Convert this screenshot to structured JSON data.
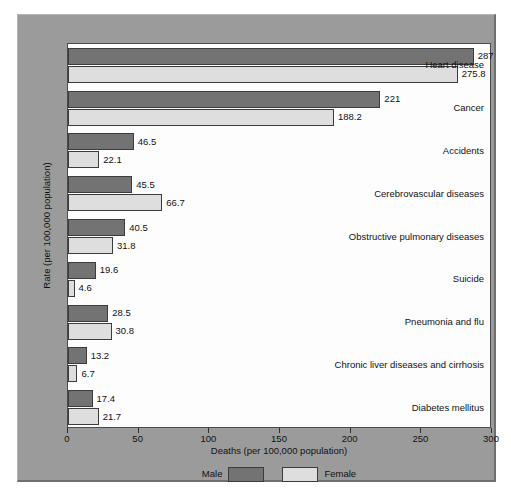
{
  "chart_data": {
    "type": "bar",
    "orientation": "horizontal",
    "title": "",
    "xlabel": "Deaths (per 100,000 population)",
    "ylabel": "Rate (per 100,000 population)",
    "xlim": [
      0,
      300
    ],
    "xticks": [
      0,
      50,
      100,
      150,
      200,
      250,
      300
    ],
    "xtick_labels": [
      "0",
      "50",
      "100",
      "150",
      "200",
      "250",
      "300"
    ],
    "grid": false,
    "legend_position": "bottom",
    "categories": [
      "Heart disease",
      "Cancer",
      "Accidents",
      "Cerebrovascular diseases",
      "Obstructive pulmonary diseases",
      "Suicide",
      "Pneumonia and flu",
      "Chronic liver diseases and cirrhosis",
      "Diabetes mellitus"
    ],
    "series": [
      {
        "name": "Male",
        "color": "#737373",
        "values": [
          287,
          221,
          46.5,
          45.5,
          40.5,
          19.6,
          28.5,
          13.2,
          17.4
        ],
        "value_labels": [
          "287",
          "221",
          "46.5",
          "45.5",
          "40.5",
          "19.6",
          "28.5",
          "13.2",
          "17.4"
        ]
      },
      {
        "name": "Female",
        "color": "#dedede",
        "values": [
          275.8,
          188.2,
          22.1,
          66.7,
          31.8,
          4.6,
          30.8,
          6.7,
          21.7
        ],
        "value_labels": [
          "275.8",
          "188.2",
          "22.1",
          "66.7",
          "31.8",
          "4.6",
          "30.8",
          "6.7",
          "21.7"
        ]
      }
    ]
  },
  "legend": {
    "entries": [
      {
        "label": "Male",
        "swatch": "male"
      },
      {
        "label": "Female",
        "swatch": "female"
      }
    ]
  }
}
